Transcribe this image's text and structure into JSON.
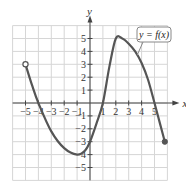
{
  "chart_data": {
    "type": "line",
    "title": "",
    "xlabel": "x",
    "ylabel": "y",
    "xlim": [
      -6,
      6
    ],
    "ylim": [
      -6,
      6
    ],
    "grid": true,
    "x_ticks": [
      -5,
      -4,
      -3,
      -2,
      -1,
      1,
      2,
      3,
      4,
      5
    ],
    "y_ticks": [
      5,
      4,
      3,
      2,
      1,
      -1,
      -2,
      -3,
      -4,
      -5
    ],
    "x_tick_labels": [
      "−5",
      "−4",
      "−3",
      "−2",
      "−1",
      "1",
      "2",
      "3",
      "4",
      "5"
    ],
    "y_tick_labels": [
      "5",
      "4",
      "3",
      "2",
      "1",
      "−1",
      "−2",
      "−3",
      "−4",
      "−5"
    ],
    "annotation": "y = f(x)",
    "series": [
      {
        "name": "y = f(x)",
        "points": [
          [
            -5,
            3
          ],
          [
            -4.5,
            1.4
          ],
          [
            -4,
            0
          ],
          [
            -3,
            -2.2
          ],
          [
            -2,
            -3.5
          ],
          [
            -1,
            -4
          ],
          [
            -0.4,
            -3.7
          ],
          [
            0,
            -3
          ],
          [
            0.5,
            -1.6
          ],
          [
            1,
            0
          ],
          [
            1.5,
            2.8
          ],
          [
            2,
            5
          ],
          [
            2.5,
            5
          ],
          [
            3,
            4.6
          ],
          [
            3.5,
            4
          ],
          [
            4,
            3.1
          ],
          [
            4.5,
            1.8
          ],
          [
            5,
            0
          ],
          [
            5.4,
            -1.5
          ],
          [
            5.8,
            -3
          ]
        ],
        "start_point": {
          "x": -5,
          "y": 3,
          "marker": "open"
        },
        "end_point": {
          "x": 5.8,
          "y": -3,
          "marker": "filled"
        },
        "x_intercepts": [
          -4,
          1,
          5
        ],
        "y_intercept": -3,
        "local_max": {
          "x": 2,
          "y": 5
        },
        "local_min": {
          "x": -1,
          "y": -4
        }
      }
    ],
    "colors": {
      "curve": "#555555",
      "grid": "#d6d6d6",
      "axis": "#444444",
      "callout_border": "#888888"
    }
  }
}
